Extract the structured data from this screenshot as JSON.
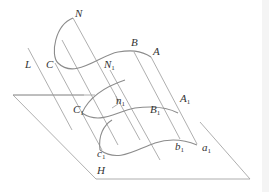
{
  "diagram": {
    "labels": {
      "N": "N",
      "B": "B",
      "A": "A",
      "L": "L",
      "C": "C",
      "N1": "N",
      "n1": "n",
      "B1": "B",
      "A1": "A",
      "C1": "C",
      "c1": "c",
      "b1": "b",
      "a1": "a",
      "H": "H",
      "sub1": "1"
    },
    "colors": {
      "lines": "#9a9a9a",
      "curves": "#8c8c8c",
      "text": "#333333",
      "background": "#ffffff"
    }
  }
}
